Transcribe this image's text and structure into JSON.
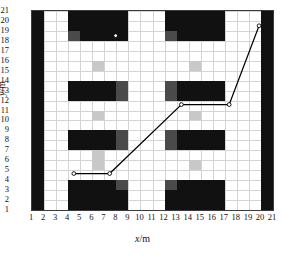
{
  "chart_data": {
    "type": "heatmap",
    "title": "",
    "xlabel": "x/m",
    "ylabel": "y/m",
    "xlim": [
      1,
      21
    ],
    "ylim": [
      1,
      21
    ],
    "grid": true,
    "legend": "none",
    "xticks": [
      "1",
      "2",
      "3",
      "4",
      "5",
      "6",
      "7",
      "8",
      "9",
      "10",
      "11",
      "12",
      "13",
      "14",
      "15",
      "16",
      "17",
      "18",
      "19",
      "20",
      "21"
    ],
    "yticks": [
      "1",
      "2",
      "3",
      "4",
      "5",
      "6",
      "7",
      "8",
      "9",
      "10",
      "11",
      "12",
      "13",
      "14",
      "15",
      "16",
      "17",
      "18",
      "19",
      "20",
      "21"
    ],
    "colors": {
      "obstacle": "#111111",
      "obstacle_edge": "#4a4a4a",
      "semi_free": "#c8c8c8",
      "free": "#ffffff",
      "grid_line": "#d4d4d4",
      "frame": "#3b3b3b",
      "path": "#000000",
      "node_fill": "#ffffff"
    },
    "cells": [
      {
        "name": "wall-left",
        "x": 1,
        "y": 1,
        "w": 1,
        "h": 20,
        "kind": "obstacle"
      },
      {
        "name": "wall-right",
        "x": 20,
        "y": 1,
        "w": 1,
        "h": 20,
        "kind": "obstacle"
      },
      {
        "name": "block-a-top",
        "x": 4,
        "y": 18,
        "w": 5,
        "h": 3,
        "kind": "obstacle"
      },
      {
        "name": "block-a-top-edge",
        "x": 4,
        "y": 18,
        "w": 1,
        "h": 1,
        "kind": "obstacle_edge"
      },
      {
        "name": "block-b-top",
        "x": 12,
        "y": 18,
        "w": 5,
        "h": 3,
        "kind": "obstacle"
      },
      {
        "name": "block-b-top-edge",
        "x": 12,
        "y": 18,
        "w": 1,
        "h": 1,
        "kind": "obstacle_edge"
      },
      {
        "name": "semi-a-upper",
        "x": 6,
        "y": 15,
        "w": 1,
        "h": 1,
        "kind": "semi_free"
      },
      {
        "name": "semi-b-upper",
        "x": 14,
        "y": 15,
        "w": 1,
        "h": 1,
        "kind": "semi_free"
      },
      {
        "name": "block-a-mid",
        "x": 4,
        "y": 12,
        "w": 5,
        "h": 2,
        "kind": "obstacle"
      },
      {
        "name": "block-a-mid-edge",
        "x": 8,
        "y": 12,
        "w": 1,
        "h": 2,
        "kind": "obstacle_edge"
      },
      {
        "name": "block-b-mid",
        "x": 12,
        "y": 12,
        "w": 5,
        "h": 2,
        "kind": "obstacle"
      },
      {
        "name": "block-b-mid-edge",
        "x": 12,
        "y": 12,
        "w": 1,
        "h": 2,
        "kind": "obstacle_edge"
      },
      {
        "name": "semi-a-center",
        "x": 6,
        "y": 10,
        "w": 1,
        "h": 1,
        "kind": "semi_free"
      },
      {
        "name": "semi-b-center",
        "x": 14,
        "y": 10,
        "w": 1,
        "h": 1,
        "kind": "semi_free"
      },
      {
        "name": "block-a-low",
        "x": 4,
        "y": 7,
        "w": 5,
        "h": 2,
        "kind": "obstacle"
      },
      {
        "name": "block-a-low-edge",
        "x": 8,
        "y": 7,
        "w": 1,
        "h": 2,
        "kind": "obstacle_edge"
      },
      {
        "name": "block-b-low",
        "x": 12,
        "y": 7,
        "w": 5,
        "h": 2,
        "kind": "obstacle"
      },
      {
        "name": "block-b-low-edge",
        "x": 12,
        "y": 7,
        "w": 1,
        "h": 2,
        "kind": "obstacle_edge"
      },
      {
        "name": "semi-a-lower",
        "x": 6,
        "y": 5,
        "w": 1,
        "h": 2,
        "kind": "semi_free"
      },
      {
        "name": "semi-b-lower",
        "x": 14,
        "y": 5,
        "w": 1,
        "h": 1,
        "kind": "semi_free"
      },
      {
        "name": "block-a-bottom",
        "x": 4,
        "y": 1,
        "w": 5,
        "h": 3,
        "kind": "obstacle"
      },
      {
        "name": "block-a-bottom-edge",
        "x": 8,
        "y": 3,
        "w": 1,
        "h": 1,
        "kind": "obstacle_edge"
      },
      {
        "name": "block-b-bottom",
        "x": 12,
        "y": 1,
        "w": 5,
        "h": 3,
        "kind": "obstacle"
      },
      {
        "name": "block-b-bottom-edge",
        "x": 12,
        "y": 3,
        "w": 1,
        "h": 1,
        "kind": "obstacle_edge"
      }
    ],
    "path": {
      "name": "planned-path",
      "points": [
        {
          "x": 4.5,
          "y": 4.5
        },
        {
          "x": 7.5,
          "y": 4.5
        },
        {
          "x": 13.5,
          "y": 11.5
        },
        {
          "x": 17.5,
          "y": 11.5
        },
        {
          "x": 20.0,
          "y": 19.5
        }
      ],
      "nodes": [
        {
          "x": 4.5,
          "y": 4.5,
          "label": "start"
        },
        {
          "x": 7.5,
          "y": 4.5,
          "label": "waypoint-1"
        },
        {
          "x": 13.5,
          "y": 11.5,
          "label": "waypoint-2"
        },
        {
          "x": 17.5,
          "y": 11.5,
          "label": "waypoint-3"
        },
        {
          "x": 20.0,
          "y": 19.5,
          "label": "goal"
        },
        {
          "x": 8.0,
          "y": 18.5,
          "label": "marker-upper"
        }
      ]
    }
  }
}
